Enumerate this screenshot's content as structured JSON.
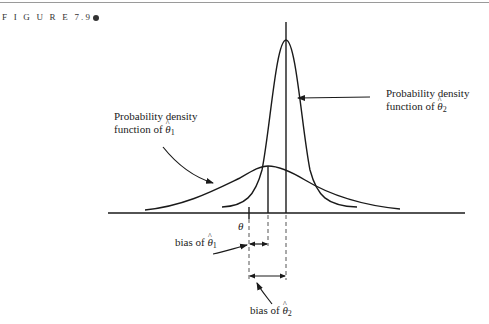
{
  "figure": {
    "label": "F I G U R E 7.9",
    "marker": "bullet"
  },
  "labels": {
    "pdf_theta2_line1": "Probability density",
    "pdf_theta2_line2": "function of",
    "pdf_theta1_line1": "Probability density",
    "pdf_theta1_line2": "function of",
    "theta": "θ",
    "theta_hat": "θ",
    "sub1": "1",
    "sub2": "2",
    "bias1_prefix": "bias of",
    "bias2_prefix": "bias of"
  },
  "colors": {
    "line": "#1a1a1a",
    "dashed": "#555555",
    "rule": "#9a9a9a"
  },
  "diagram": {
    "axis": {
      "x1": 108,
      "x2": 465,
      "y": 213
    },
    "true_theta_x": 249,
    "mean_theta1_hat_x": 268,
    "mean_theta2_hat_x": 286,
    "wide_curve_peak_y": 166,
    "narrow_curve_peak_y": 40
  }
}
